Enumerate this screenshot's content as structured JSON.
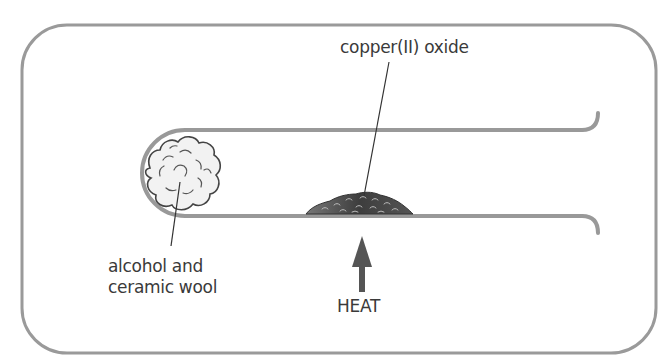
{
  "diagram": {
    "type": "apparatus",
    "labels": {
      "copper_oxide": "copper(II) oxide",
      "wool_line1": "alcohol and",
      "wool_line2": "ceramic wool",
      "heat": "HEAT"
    },
    "colors": {
      "frame": "#9a9a9a",
      "tube": "#999999",
      "wool_fill": "#f2f2f2",
      "wool_outline": "#444444",
      "oxide_fill": "#4a4a4a",
      "arrow": "#555555",
      "text": "#3a3a3a"
    }
  }
}
